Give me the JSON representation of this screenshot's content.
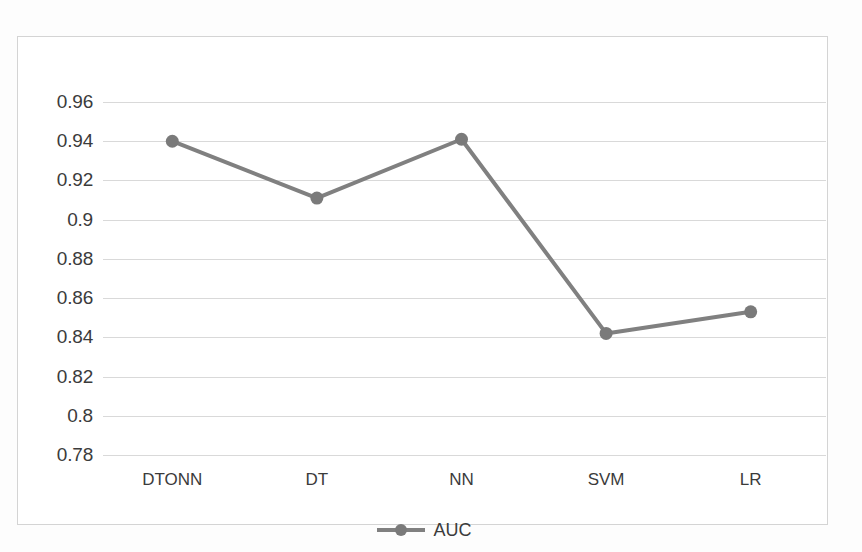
{
  "chart_data": {
    "type": "line",
    "title": "",
    "subtitle": "",
    "xlabel": "",
    "ylabel": "",
    "categories": [
      "DTONN",
      "DT",
      "NN",
      "SVM",
      "LR"
    ],
    "series": [
      {
        "name": "AUC",
        "values": [
          0.94,
          0.911,
          0.941,
          0.842,
          0.853
        ],
        "color": "#808080",
        "marker": "circle",
        "line_width": 4
      }
    ],
    "ylim": [
      0.78,
      0.96
    ],
    "ytick_labels": [
      "0.96",
      "0.94",
      "0.92",
      "0.9",
      "0.88",
      "0.86",
      "0.84",
      "0.82",
      "0.8",
      "0.78"
    ],
    "ytick_values": [
      0.96,
      0.94,
      0.92,
      0.9,
      0.88,
      0.86,
      0.84,
      0.82,
      0.8,
      0.78
    ],
    "grid": true,
    "grid_color": "#d9d9d9",
    "legend_position": "bottom",
    "legend_entries": [
      "AUC"
    ],
    "plot_border_color": "#d4d4d4",
    "background_color": "#ffffff",
    "text_color": "#3b3b3b"
  },
  "legend": {
    "auc_label": "AUC"
  }
}
